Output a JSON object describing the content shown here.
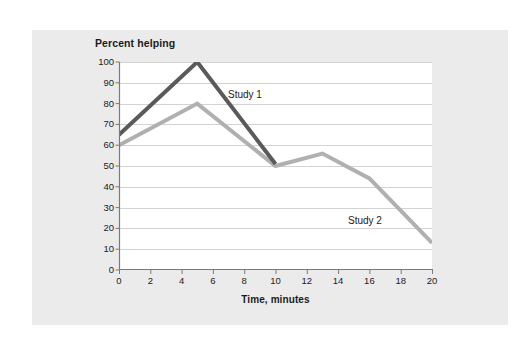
{
  "figure": {
    "page_background": "#ffffff",
    "card_background": "#ebebeb",
    "plot_background": "#ffffff"
  },
  "chart_data": {
    "type": "line",
    "title": "Percent helping",
    "subtitle": "",
    "xlabel": "Time, minutes",
    "ylabel": "Percent helping",
    "xlim": [
      0,
      20
    ],
    "ylim": [
      0,
      100
    ],
    "xticks": [
      0,
      2,
      4,
      6,
      8,
      10,
      12,
      14,
      16,
      18,
      20
    ],
    "xtick_labels": [
      "0",
      "2",
      "4",
      "6",
      "8",
      "10",
      "12",
      "14",
      "16",
      "18",
      "20"
    ],
    "yticks": [
      0,
      10,
      20,
      30,
      40,
      50,
      60,
      70,
      80,
      90,
      100
    ],
    "ytick_labels": [
      "0",
      "10",
      "20",
      "30",
      "40",
      "50",
      "60",
      "70",
      "80",
      "90",
      "100"
    ],
    "grid": "horizontal",
    "grid_color": "#d3d3d3",
    "axis_color": "#7a7a7a",
    "legend": "inline annotations",
    "legend_position": "inline",
    "series": [
      {
        "name": "Study 1",
        "color": "#5a5a5a",
        "line_width": 4,
        "x": [
          0,
          5,
          10
        ],
        "values": [
          65,
          100,
          51
        ],
        "annotation": "Study 1"
      },
      {
        "name": "Study 2",
        "color": "#b0b0b0",
        "line_width": 4,
        "x": [
          0,
          5,
          10,
          13,
          16,
          20
        ],
        "values": [
          60,
          80,
          50,
          56,
          44,
          13
        ],
        "annotation": "Study 2"
      }
    ]
  }
}
